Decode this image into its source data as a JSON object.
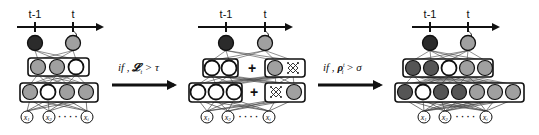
{
  "colors": {
    "dark": "#2b2b2b",
    "mid_dark": "#555555",
    "gray": "#a0a0a0",
    "white": "#ffffff",
    "stroke": "#111111",
    "edge": "#444444"
  },
  "panels": [
    {
      "id": "panel-1",
      "timeline": {
        "x1": 17,
        "x2": 102,
        "y": 27,
        "ticks": [
          {
            "label": "t-1",
            "x": 35
          },
          {
            "label": "t",
            "x": 73
          }
        ]
      },
      "outputs": [
        {
          "x": 35,
          "y": 43,
          "fill": "dark"
        },
        {
          "x": 73,
          "y": 43,
          "fill": "gray"
        }
      ],
      "layers": [
        {
          "name": "hidden-2",
          "boxes": [
            {
              "x": 28,
              "y": 58,
              "w": 61,
              "h": 18
            }
          ],
          "nodes": [
            {
              "x": 38,
              "fill": "gray"
            },
            {
              "x": 57,
              "fill": "gray"
            },
            {
              "x": 76,
              "fill": "white"
            }
          ],
          "y": 67
        },
        {
          "name": "hidden-1",
          "boxes": [
            {
              "x": 20,
              "y": 83,
              "w": 78,
              "h": 19
            }
          ],
          "nodes": [
            {
              "x": 30,
              "fill": "gray"
            },
            {
              "x": 48,
              "fill": "white"
            },
            {
              "x": 67,
              "fill": "gray"
            },
            {
              "x": 86,
              "fill": "gray"
            }
          ],
          "y": 92
        }
      ],
      "inputs": [
        {
          "x": 27,
          "label": "x1"
        },
        {
          "x": 49,
          "label": "x2"
        },
        {
          "x": 87,
          "label": "xi"
        }
      ],
      "input_y": 117
    },
    {
      "id": "panel-2",
      "timeline": {
        "x1": 198,
        "x2": 291,
        "y": 27,
        "ticks": [
          {
            "label": "t-1",
            "x": 226
          },
          {
            "label": "t",
            "x": 265
          }
        ]
      },
      "outputs": [
        {
          "x": 226,
          "y": 43,
          "fill": "dark"
        },
        {
          "x": 265,
          "y": 43,
          "fill": "gray"
        }
      ],
      "layers": [
        {
          "name": "hidden-2",
          "boxes": [
            {
              "x": 203,
              "y": 59,
              "w": 35,
              "h": 18
            },
            {
              "x": 265,
              "y": 59,
              "w": 40,
              "h": 18
            }
          ],
          "nodes": [
            {
              "x": 212,
              "fill": "white"
            },
            {
              "x": 229,
              "fill": "white"
            },
            {
              "x": 275,
              "fill": "gray"
            },
            {
              "x": 293,
              "fill": "hatch"
            }
          ],
          "y": 68,
          "plus_x": 252
        },
        {
          "name": "hidden-1",
          "boxes": [
            {
              "x": 189,
              "y": 83,
              "w": 53,
              "h": 19
            },
            {
              "x": 265,
              "y": 83,
              "w": 40,
              "h": 19
            }
          ],
          "nodes": [
            {
              "x": 198,
              "fill": "white"
            },
            {
              "x": 216,
              "fill": "white"
            },
            {
              "x": 234,
              "fill": "white"
            },
            {
              "x": 276,
              "fill": "hatch"
            },
            {
              "x": 294,
              "fill": "gray"
            }
          ],
          "y": 92,
          "plus_x": 254
        }
      ],
      "inputs": [
        {
          "x": 207,
          "label": "x1"
        },
        {
          "x": 228,
          "label": "x2"
        },
        {
          "x": 269,
          "label": "xi"
        }
      ],
      "input_y": 117
    },
    {
      "id": "panel-3",
      "timeline": {
        "x1": 412,
        "x2": 498,
        "y": 27,
        "ticks": [
          {
            "label": "t-1",
            "x": 430
          },
          {
            "label": "t",
            "x": 468
          }
        ]
      },
      "outputs": [
        {
          "x": 430,
          "y": 43,
          "fill": "dark"
        },
        {
          "x": 468,
          "y": 43,
          "fill": "gray"
        }
      ],
      "layers": [
        {
          "name": "hidden-2",
          "boxes": [
            {
              "x": 403,
              "y": 59,
              "w": 90,
              "h": 18
            }
          ],
          "nodes": [
            {
              "x": 413,
              "fill": "mid_dark"
            },
            {
              "x": 431,
              "fill": "mid_dark"
            },
            {
              "x": 449,
              "fill": "white"
            },
            {
              "x": 467,
              "fill": "gray"
            },
            {
              "x": 485,
              "fill": "gray"
            }
          ],
          "y": 68
        },
        {
          "name": "hidden-1",
          "boxes": [
            {
              "x": 395,
              "y": 83,
              "w": 129,
              "h": 19
            }
          ],
          "nodes": [
            {
              "x": 405,
              "fill": "mid_dark"
            },
            {
              "x": 423,
              "fill": "white"
            },
            {
              "x": 441,
              "fill": "mid_dark"
            },
            {
              "x": 459,
              "fill": "mid_dark"
            },
            {
              "x": 477,
              "fill": "gray"
            },
            {
              "x": 495,
              "fill": "gray"
            },
            {
              "x": 513,
              "fill": "gray"
            }
          ],
          "y": 92
        }
      ],
      "inputs": [
        {
          "x": 424,
          "label": "x1"
        },
        {
          "x": 445,
          "label": "x2"
        },
        {
          "x": 486,
          "label": "xi"
        }
      ],
      "input_y": 117
    }
  ],
  "transitions": [
    {
      "id": "transition-loss",
      "x1": 112,
      "x2": 180,
      "y": 85,
      "label_prefix": "if , ",
      "label_symbol": "𝓛",
      "label_sub": "t",
      "label_suffix": " > τ",
      "label_x": 118,
      "label_y": 71
    },
    {
      "id": "transition-rho",
      "x1": 318,
      "x2": 386,
      "y": 85,
      "label_prefix": "if , ",
      "label_symbol": "ρ",
      "label_sub": "i",
      "label_sup": "t",
      "label_suffix": " > σ",
      "label_x": 323,
      "label_y": 71
    }
  ],
  "input_labels": {
    "x1": {
      "base": "x",
      "sub": "1"
    },
    "x2": {
      "base": "x",
      "sub": "2"
    },
    "xi": {
      "base": "x",
      "sub": "i"
    }
  },
  "ellipsis": "· · · ·"
}
